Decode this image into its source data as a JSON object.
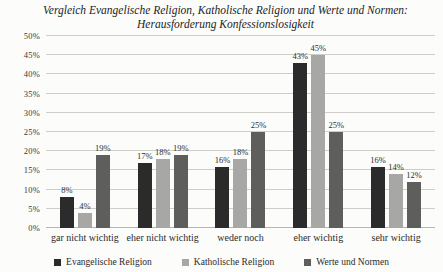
{
  "chart_data": {
    "type": "bar",
    "title": "Vergleich Evangelische Religion, Katholische Religion und Werte und Normen: Herausforderung Konfessionslosigkeit",
    "categories": [
      "gar nicht wichtig",
      "eher nicht wichtig",
      "weder noch",
      "eher wichtig",
      "sehr wichtig"
    ],
    "series": [
      {
        "name": "Evangelische Religion",
        "color": "#2b2b2b",
        "values": [
          8,
          17,
          16,
          43,
          16
        ]
      },
      {
        "name": "Katholische Religion",
        "color": "#a7a7a5",
        "values": [
          4,
          18,
          18,
          45,
          14
        ]
      },
      {
        "name": "Werte und Normen",
        "color": "#5e5e5c",
        "values": [
          19,
          19,
          25,
          25,
          12
        ]
      }
    ],
    "value_suffix": "%",
    "ylim": [
      0,
      50
    ],
    "ytick_step": 5,
    "yticks": [
      "0%",
      "5%",
      "10%",
      "15%",
      "20%",
      "25%",
      "30%",
      "35%",
      "40%",
      "45%",
      "50%"
    ],
    "grid": true,
    "legend_position": "bottom",
    "colors": {
      "background": "#fcfcfa",
      "gridline": "#cfcec9",
      "text": "#2b2b2b"
    }
  }
}
